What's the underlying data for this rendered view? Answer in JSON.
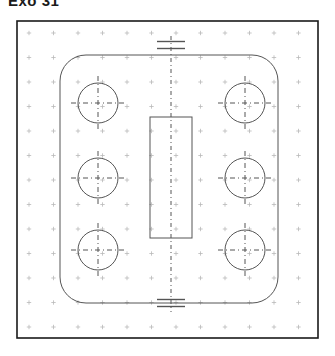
{
  "title": "Exo 31",
  "drawing": {
    "name": "technical-plate-drawing",
    "type": "cad-sketch",
    "background_color": "#ffffff",
    "line_color": "#555555",
    "frame_color": "#1a1a1a",
    "grid_color": "#b9b9b9",
    "frame": {
      "label": "drawing-frame",
      "x": 17,
      "y": 21,
      "width": 301,
      "height": 317,
      "stroke_width": 1.6
    },
    "grid": {
      "label": "dot-grid",
      "spacing": 24.5,
      "origin_x": 29,
      "origin_y": 33,
      "cols": 12,
      "rows": 13,
      "mark": "plus",
      "mark_size": 2.2
    },
    "plate": {
      "label": "rounded-plate-outline",
      "x": 60,
      "y": 55,
      "width": 218,
      "height": 248,
      "corner_radius": 26,
      "stroke_width": 1.0
    },
    "center_rectangle": {
      "label": "center-rectangle",
      "x": 150,
      "y": 117,
      "width": 42,
      "height": 121,
      "stroke_width": 1.0
    },
    "centerline": {
      "label": "vertical-centerline",
      "x": 171,
      "y_top": 36,
      "y_bottom": 312,
      "dash": "4 3 1 3",
      "stroke_width": 1.0
    },
    "symmetry_markers": [
      {
        "label": "symmetry-marker-top",
        "cx": 171,
        "cy": 45,
        "bar_half_width": 14,
        "gap": 7
      },
      {
        "label": "symmetry-marker-bottom",
        "cx": 171,
        "cy": 303,
        "bar_half_width": 14,
        "gap": 7
      }
    ],
    "holes": [
      {
        "label": "hole-top-left",
        "cx": 98,
        "cy": 103,
        "r": 20
      },
      {
        "label": "hole-top-right",
        "cx": 245,
        "cy": 103,
        "r": 20
      },
      {
        "label": "hole-middle-left",
        "cx": 98,
        "cy": 178,
        "r": 20
      },
      {
        "label": "hole-middle-right",
        "cx": 245,
        "cy": 178,
        "r": 20
      },
      {
        "label": "hole-bottom-left",
        "cx": 98,
        "cy": 250,
        "r": 20
      },
      {
        "label": "hole-bottom-right",
        "cx": 245,
        "cy": 250,
        "r": 20
      }
    ],
    "hole_crosshair": {
      "label": "hole-centerline-crosshair",
      "overhang": 7,
      "dash": "5 3 1 3",
      "stroke_width": 1.0
    }
  }
}
